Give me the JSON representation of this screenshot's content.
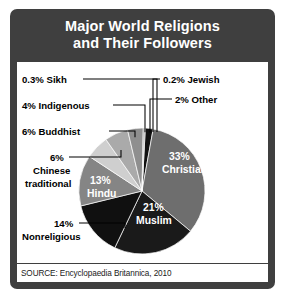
{
  "title": {
    "line1": "Major World Religions",
    "line2": "and Their Followers"
  },
  "source": "SOURCE: Encyclopaedia Britannica, 2010",
  "colors": {
    "panel_background": "#3f3f3f",
    "chart_background": "#ffffff",
    "title_text": "#ffffff",
    "label_text": "#000000",
    "inside_label_text": "#ffffff"
  },
  "chart_data": {
    "type": "pie",
    "title": "Major World Religions and Their Followers",
    "unit": "percent",
    "legend": "none",
    "source": "SOURCE: Encyclopaedia Britannica, 2010",
    "categories": [
      "Christian",
      "Muslim",
      "Nonreligious",
      "Hindu",
      "Chinese traditional",
      "Buddhist",
      "Indigenous",
      "Sikh",
      "Jewish",
      "Other"
    ],
    "values": [
      33,
      21,
      14,
      13,
      6,
      6,
      4,
      0.3,
      0.2,
      2
    ],
    "slices": [
      {
        "label": "33%\nChristian",
        "name": "Christian",
        "value": 33,
        "display": "33%",
        "line2": "Christian",
        "color": "#6e6e6e",
        "label_position": "inside"
      },
      {
        "label": "21%\nMuslim",
        "name": "Muslim",
        "value": 21,
        "display": "21%",
        "line2": "Muslim",
        "color": "#1a1a1a",
        "label_position": "inside"
      },
      {
        "label": "14%\nNonreligious",
        "name": "Nonreligious",
        "value": 14,
        "display": "14%",
        "line2": "Nonreligious",
        "color": "#101010",
        "label_position": "outside-left"
      },
      {
        "label": "13%\nHindu",
        "name": "Hindu",
        "value": 13,
        "display": "13%",
        "line2": "Hindu",
        "color": "#858585",
        "label_position": "inside"
      },
      {
        "label": "6%\nChinese traditional",
        "name": "Chinese traditional",
        "value": 6,
        "display": "6%",
        "line2": "Chinese",
        "line3": "traditional",
        "color": "#cfcfcf",
        "label_position": "outside-left"
      },
      {
        "label": "6% Buddhist",
        "name": "Buddhist",
        "value": 6,
        "display": "6% Buddhist",
        "color": "#aaaaaa",
        "label_position": "outside-left"
      },
      {
        "label": "4% Indigenous",
        "name": "Indigenous",
        "value": 4,
        "display": "4% Indigenous",
        "color": "#8f8f8f",
        "label_position": "outside-left"
      },
      {
        "label": "0.3% Sikh",
        "name": "Sikh",
        "value": 0.3,
        "display": "0.3% Sikh",
        "color": "#5a5a5a",
        "label_position": "outside-left"
      },
      {
        "label": "0.2% Jewish",
        "name": "Jewish",
        "value": 0.2,
        "display": "0.2% Jewish",
        "color": "#2b2b2b",
        "label_position": "outside-right"
      },
      {
        "label": "2% Other",
        "name": "Other",
        "value": 2,
        "display": "2% Other",
        "color": "#111111",
        "label_position": "outside-right"
      }
    ],
    "labels_outside_left": [
      {
        "text": "0.3% Sikh",
        "value": 0.3
      },
      {
        "text": "4% Indigenous",
        "value": 4
      },
      {
        "text": "6% Buddhist",
        "value": 6
      },
      {
        "text": "6%",
        "value": 6
      },
      {
        "text": "Chinese",
        "value": 6
      },
      {
        "text": "traditional",
        "value": 6
      },
      {
        "text": "14%",
        "value": 14
      },
      {
        "text": "Nonreligious",
        "value": 14
      }
    ],
    "labels_outside_right": [
      {
        "text": "0.2% Jewish",
        "value": 0.2
      },
      {
        "text": "2% Other",
        "value": 2
      }
    ],
    "labels_inside": [
      {
        "text": "33%",
        "value": 33
      },
      {
        "text": "Christian",
        "value": 33
      },
      {
        "text": "13%",
        "value": 13
      },
      {
        "text": "Hindu",
        "value": 13
      },
      {
        "text": "21%",
        "value": 21
      },
      {
        "text": "Muslim",
        "value": 21
      }
    ]
  }
}
